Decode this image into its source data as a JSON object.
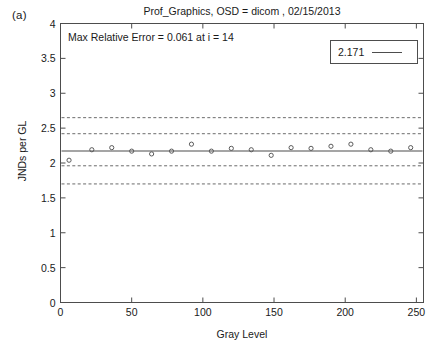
{
  "panel_label": "(a)",
  "annotation": "Max Relative Error = 0.061 at i = 14",
  "legend": {
    "value_label": "2.171",
    "line_sample": "line-sample"
  },
  "chart_data": {
    "type": "scatter",
    "title": "Prof_Graphics, OSD = dicom , 02/15/2013",
    "xlabel": "Gray Level",
    "ylabel": "JNDs per GL",
    "xlim": [
      0,
      255
    ],
    "ylim": [
      0,
      4
    ],
    "xticks": [
      0,
      50,
      100,
      150,
      200,
      250
    ],
    "xtick_labels": [
      "0",
      "50",
      "100",
      "150",
      "200",
      "250"
    ],
    "yticks": [
      0,
      0.5,
      1,
      1.5,
      2,
      2.5,
      3,
      3.5,
      4
    ],
    "ytick_labels": [
      "0",
      "0.5",
      "1",
      "1.5",
      "2",
      "2.5",
      "3",
      "3.5",
      "4"
    ],
    "grid": false,
    "legend_position": "upper right",
    "mean_line": {
      "label": "2.171",
      "value": 2.171,
      "style": "solid",
      "color": "#4d4d4d"
    },
    "reference_lines": [
      {
        "name": "outer-upper",
        "value": 2.65,
        "style": "dashed",
        "color": "#6b6b6b"
      },
      {
        "name": "inner-upper",
        "value": 2.42,
        "style": "dashed",
        "color": "#6b6b6b"
      },
      {
        "name": "inner-lower",
        "value": 1.96,
        "style": "dashed",
        "color": "#6b6b6b"
      },
      {
        "name": "outer-lower",
        "value": 1.7,
        "style": "dashed",
        "color": "#6b6b6b"
      }
    ],
    "series": [
      {
        "name": "JNDs per GL",
        "marker": "open-circle",
        "color": "#5a5a5a",
        "x": [
          6,
          22,
          36,
          50,
          64,
          78,
          92,
          106,
          120,
          134,
          148,
          162,
          176,
          190,
          204,
          218,
          232,
          246
        ],
        "y": [
          2.04,
          2.19,
          2.22,
          2.17,
          2.13,
          2.17,
          2.27,
          2.17,
          2.21,
          2.19,
          2.11,
          2.22,
          2.21,
          2.24,
          2.27,
          2.19,
          2.17,
          2.22
        ]
      }
    ]
  },
  "axes_colors": {
    "frame": "#4d4d4d",
    "text": "#1a1a1a",
    "marker": "#5a5a5a"
  }
}
